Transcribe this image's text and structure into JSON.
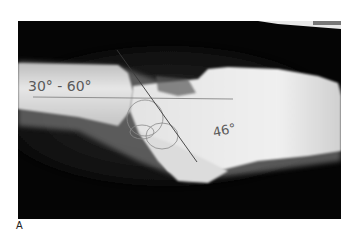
{
  "figure": {
    "panel_label": "A",
    "image_description": "Lateral radiograph of a foot/ankle with angle measurement lines drawn",
    "annotations": [
      {
        "text": "30° - 60°",
        "position": "left, over tibia shaft"
      },
      {
        "text": "46°",
        "position": "right, over hindfoot"
      }
    ],
    "lines": [
      {
        "type": "horizontal-axis-line"
      },
      {
        "type": "diagonal-axis-line"
      },
      {
        "type": "talar-dome-circle"
      }
    ],
    "colors": {
      "background": "#050505",
      "bone": "#e8e8e8",
      "page": "#ffffff",
      "ink": "#555555"
    }
  }
}
